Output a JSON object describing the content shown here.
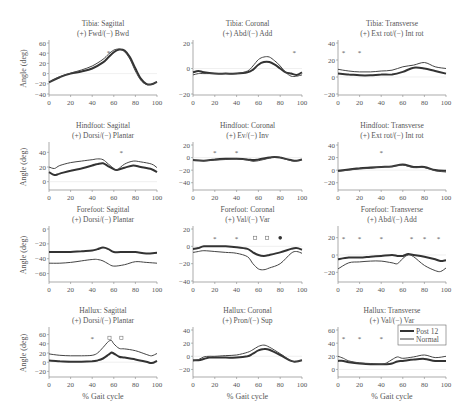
{
  "figure": {
    "legend": [
      {
        "label": "Post 12",
        "color": "#333333",
        "width": 2.0
      },
      {
        "label": "Normal",
        "color": "#444444",
        "width": 1.0
      }
    ],
    "xlabel": "% Gait cycle",
    "ylabel": "Angle (deg)"
  },
  "chart_data": [
    {
      "type": "line",
      "title": "Tibia: Sagittal",
      "subtitle": "(+) Fwd/(−) Bwd",
      "xlim": [
        0,
        100
      ],
      "ylim": [
        -40,
        60
      ],
      "yticks": [
        -40,
        -20,
        0,
        20,
        40,
        60
      ],
      "xticks": [
        0,
        20,
        40,
        60,
        80,
        100
      ],
      "x": [
        0,
        10,
        20,
        30,
        40,
        50,
        55,
        60,
        65,
        70,
        75,
        80,
        85,
        90,
        95,
        100
      ],
      "series": [
        {
          "name": "Post 12",
          "values": [
            -17,
            -7,
            0,
            4,
            10,
            22,
            32,
            42,
            47,
            45,
            32,
            10,
            -10,
            -20,
            -21,
            -16
          ]
        },
        {
          "name": "Normal",
          "values": [
            -17,
            -6,
            1,
            7,
            15,
            28,
            38,
            46,
            48,
            43,
            28,
            5,
            -13,
            -21,
            -21,
            -16
          ]
        }
      ],
      "markers": [
        {
          "x": 55,
          "type": "*"
        }
      ]
    },
    {
      "type": "line",
      "title": "Tibia: Coronal",
      "subtitle": "(+) Abd/(−) Add",
      "xlim": [
        0,
        100
      ],
      "ylim": [
        -20,
        20
      ],
      "yticks": [
        -20,
        0,
        20
      ],
      "xticks": [
        0,
        20,
        40,
        60,
        80,
        100
      ],
      "x": [
        0,
        5,
        10,
        20,
        30,
        40,
        50,
        55,
        60,
        65,
        70,
        75,
        80,
        85,
        90,
        95,
        100
      ],
      "series": [
        {
          "name": "Post 12",
          "values": [
            -3,
            -2,
            -3,
            -4,
            -4,
            -4,
            -3,
            -1,
            3,
            5,
            5,
            3,
            0,
            -3,
            -4,
            -5,
            -3
          ]
        },
        {
          "name": "Normal",
          "values": [
            -5,
            -4,
            -4,
            -4,
            -4,
            -4,
            -2,
            2,
            7,
            9,
            9,
            6,
            2,
            -3,
            -6,
            -6,
            -5
          ]
        }
      ],
      "markers": [
        {
          "x": 93,
          "type": "*"
        }
      ]
    },
    {
      "type": "line",
      "title": "Tibia: Transverse",
      "subtitle": "(+) Ext rot/(−) Int rot",
      "xlim": [
        0,
        100
      ],
      "ylim": [
        -20,
        40
      ],
      "yticks": [
        -20,
        0,
        20,
        40
      ],
      "xticks": [
        0,
        20,
        40,
        60,
        80,
        100
      ],
      "x": [
        0,
        10,
        20,
        30,
        40,
        50,
        60,
        70,
        80,
        90,
        100
      ],
      "series": [
        {
          "name": "Post 12",
          "values": [
            4,
            3,
            2,
            2,
            3,
            3,
            6,
            11,
            10,
            7,
            4
          ]
        },
        {
          "name": "Normal",
          "values": [
            9,
            7,
            6,
            6,
            7,
            8,
            12,
            14,
            17,
            12,
            10
          ]
        }
      ],
      "markers": [
        {
          "x": 5,
          "type": "*"
        },
        {
          "x": 20,
          "type": "*"
        }
      ]
    },
    {
      "type": "line",
      "title": "Hindfoot: Sagittal",
      "subtitle": "(+) Dorsi/(−) Plantar",
      "xlim": [
        0,
        100
      ],
      "ylim": [
        -10,
        50
      ],
      "yticks": [
        0,
        20,
        40
      ],
      "xticks": [
        0,
        20,
        40,
        60,
        80,
        100
      ],
      "x": [
        0,
        5,
        10,
        20,
        30,
        40,
        45,
        50,
        55,
        60,
        63,
        70,
        78,
        85,
        95,
        100
      ],
      "series": [
        {
          "name": "Post 12",
          "values": [
            13,
            9,
            11,
            15,
            18,
            22,
            24,
            25,
            21,
            17,
            16,
            19,
            22,
            20,
            17,
            13
          ]
        },
        {
          "name": "Normal",
          "values": [
            20,
            18,
            22,
            26,
            28,
            30,
            31,
            30,
            24,
            18,
            16,
            24,
            28,
            27,
            24,
            19
          ]
        }
      ],
      "markers": [
        {
          "x": 67,
          "type": "*"
        }
      ]
    },
    {
      "type": "line",
      "title": "Hindfoot: Coronal",
      "subtitle": "(+) Ev/(−) Inv",
      "xlim": [
        0,
        100
      ],
      "ylim": [
        -50,
        20
      ],
      "yticks": [
        -40,
        -20,
        0,
        20
      ],
      "xticks": [
        0,
        20,
        40,
        60,
        80,
        100
      ],
      "x": [
        0,
        10,
        20,
        30,
        40,
        50,
        55,
        60,
        70,
        75,
        80,
        90,
        95,
        100
      ],
      "series": [
        {
          "name": "Post 12",
          "values": [
            -4,
            -5,
            -3,
            -2,
            -2,
            -3,
            -4,
            -3,
            0,
            1,
            0,
            -4,
            -5,
            -3
          ]
        },
        {
          "name": "Normal",
          "values": [
            -4,
            -5,
            -4,
            -3,
            -2,
            -4,
            -6,
            -5,
            -1,
            1,
            0,
            -5,
            -5,
            -3
          ]
        }
      ],
      "markers": [
        {
          "x": 20,
          "type": "*"
        },
        {
          "x": 40,
          "type": "*"
        }
      ]
    },
    {
      "type": "line",
      "title": "Hindfoot: Transverse",
      "subtitle": "(+) Ext rot/(−) Int rot",
      "xlim": [
        0,
        100
      ],
      "ylim": [
        -30,
        40
      ],
      "yticks": [
        -20,
        0,
        20,
        40
      ],
      "xticks": [
        0,
        20,
        40,
        60,
        80,
        100
      ],
      "x": [
        0,
        10,
        20,
        30,
        40,
        50,
        60,
        70,
        80,
        90,
        100
      ],
      "series": [
        {
          "name": "Post 12",
          "values": [
            -1,
            1,
            3,
            4,
            5,
            6,
            9,
            5,
            5,
            0,
            -1
          ]
        },
        {
          "name": "Normal",
          "values": [
            -2,
            0,
            2,
            3,
            5,
            6,
            8,
            4,
            4,
            -1,
            -3
          ]
        }
      ],
      "markers": [
        {
          "x": 40,
          "type": "*"
        }
      ]
    },
    {
      "type": "line",
      "title": "Forefoot: Sagittal",
      "subtitle": "(+) Dorsi/(−) Plantar",
      "xlim": [
        0,
        100
      ],
      "ylim": [
        -70,
        0
      ],
      "yticks": [
        -60,
        -40,
        -20,
        0
      ],
      "xticks": [
        0,
        20,
        40,
        60,
        80,
        100
      ],
      "x": [
        0,
        10,
        20,
        30,
        40,
        45,
        50,
        55,
        60,
        70,
        80,
        90,
        100
      ],
      "series": [
        {
          "name": "Post 12",
          "values": [
            -31,
            -31,
            -31,
            -30,
            -29,
            -27,
            -25,
            -27,
            -31,
            -31,
            -31,
            -33,
            -32
          ]
        },
        {
          "name": "Normal",
          "values": [
            -46,
            -46,
            -45,
            -43,
            -41,
            -41,
            -43,
            -47,
            -50,
            -48,
            -44,
            -45,
            -46
          ]
        }
      ],
      "markers": []
    },
    {
      "type": "line",
      "title": "Forefoot: Coronal",
      "subtitle": "(+) Val/(−) Var",
      "xlim": [
        0,
        100
      ],
      "ylim": [
        -40,
        20
      ],
      "yticks": [
        -40,
        -20,
        0,
        20
      ],
      "xticks": [
        0,
        20,
        40,
        60,
        80,
        100
      ],
      "x": [
        0,
        5,
        10,
        20,
        30,
        40,
        50,
        55,
        60,
        65,
        70,
        80,
        90,
        95,
        100
      ],
      "series": [
        {
          "name": "Post 12",
          "values": [
            -3,
            -2,
            0,
            0,
            0,
            -1,
            -3,
            -7,
            -10,
            -11,
            -10,
            -7,
            -3,
            -2,
            -4
          ]
        },
        {
          "name": "Normal",
          "values": [
            -7,
            -6,
            -5,
            -6,
            -7,
            -8,
            -12,
            -20,
            -26,
            -27,
            -25,
            -20,
            -8,
            -6,
            -8
          ]
        }
      ],
      "markers": [
        {
          "x": 20,
          "type": "*"
        },
        {
          "x": 40,
          "type": "*"
        },
        {
          "x": 57,
          "type": "o"
        },
        {
          "x": 68,
          "type": "o"
        },
        {
          "x": 80,
          "type": "filled"
        }
      ]
    },
    {
      "type": "line",
      "title": "Forefoot: Transverse",
      "subtitle": "(+) Abd/(−) Add",
      "xlim": [
        0,
        100
      ],
      "ylim": [
        -30,
        30
      ],
      "yticks": [
        -20,
        0,
        20
      ],
      "xticks": [
        0,
        20,
        40,
        60,
        80,
        100
      ],
      "x": [
        0,
        10,
        20,
        30,
        40,
        50,
        55,
        60,
        65,
        70,
        80,
        90,
        95,
        100
      ],
      "series": [
        {
          "name": "Post 12",
          "values": [
            -5,
            -3,
            -3,
            -2,
            -1,
            0,
            -1,
            -1,
            1,
            0,
            -2,
            -5,
            -7,
            -6
          ]
        },
        {
          "name": "Normal",
          "values": [
            -16,
            -9,
            -8,
            -7,
            -7,
            -9,
            -10,
            -4,
            0,
            -2,
            -12,
            -18,
            -19,
            -15
          ]
        }
      ],
      "markers": [
        {
          "x": 5,
          "type": "*"
        },
        {
          "x": 20,
          "type": "*"
        },
        {
          "x": 40,
          "type": "*"
        },
        {
          "x": 68,
          "type": "*"
        },
        {
          "x": 80,
          "type": "*"
        },
        {
          "x": 93,
          "type": "*"
        }
      ]
    },
    {
      "type": "line",
      "title": "Hallux: Sagittal",
      "subtitle": "(+) Dorsi/(−) Plantar",
      "xlim": [
        0,
        100
      ],
      "ylim": [
        -30,
        70
      ],
      "yticks": [
        -20,
        0,
        20,
        40,
        60
      ],
      "xticks": [
        0,
        20,
        40,
        60,
        80,
        100
      ],
      "x": [
        0,
        10,
        20,
        30,
        40,
        45,
        50,
        55,
        58,
        60,
        65,
        70,
        80,
        90,
        95,
        100
      ],
      "series": [
        {
          "name": "Post 12",
          "values": [
            4,
            2,
            1,
            1,
            2,
            4,
            8,
            16,
            21,
            19,
            12,
            10,
            6,
            1,
            -2,
            3
          ]
        },
        {
          "name": "Normal",
          "values": [
            18,
            15,
            14,
            14,
            15,
            20,
            32,
            45,
            47,
            40,
            30,
            29,
            25,
            17,
            14,
            19
          ]
        }
      ],
      "markers": [
        {
          "x": 40,
          "type": "*"
        },
        {
          "x": 56,
          "type": "o"
        },
        {
          "x": 67,
          "type": "o"
        }
      ]
    },
    {
      "type": "line",
      "title": "Hallux: Coronal",
      "subtitle": "(+) Pron/(−) Sup",
      "xlim": [
        0,
        100
      ],
      "ylim": [
        -30,
        40
      ],
      "yticks": [
        -20,
        0,
        20,
        40
      ],
      "xticks": [
        0,
        20,
        40,
        60,
        80,
        100
      ],
      "x": [
        0,
        5,
        10,
        15,
        20,
        30,
        40,
        50,
        55,
        60,
        65,
        70,
        80,
        90,
        95,
        100
      ],
      "series": [
        {
          "name": "Post 12",
          "values": [
            -6,
            -6,
            -4,
            -2,
            -2,
            -2,
            -2,
            0,
            4,
            9,
            11,
            10,
            2,
            -7,
            -8,
            -6
          ]
        },
        {
          "name": "Normal",
          "values": [
            -7,
            -5,
            -1,
            0,
            0,
            1,
            2,
            6,
            10,
            15,
            17,
            14,
            4,
            -7,
            -8,
            -6
          ]
        }
      ],
      "markers": []
    },
    {
      "type": "line",
      "title": "Hallux: Transverse",
      "subtitle": "(+) Val/(−) Var",
      "xlim": [
        0,
        100
      ],
      "ylim": [
        -10,
        60
      ],
      "yticks": [
        0,
        20,
        40,
        60
      ],
      "xticks": [
        0,
        20,
        40,
        60,
        80,
        100
      ],
      "x": [
        0,
        5,
        10,
        20,
        30,
        40,
        45,
        50,
        55,
        60,
        70,
        80,
        90,
        100
      ],
      "series": [
        {
          "name": "Post 12",
          "values": [
            13,
            13,
            11,
            9,
            8,
            8,
            8,
            9,
            12,
            13,
            15,
            16,
            13,
            13
          ]
        },
        {
          "name": "Normal",
          "values": [
            20,
            17,
            13,
            10,
            9,
            8,
            10,
            15,
            19,
            17,
            19,
            22,
            18,
            20
          ]
        }
      ],
      "markers": [
        {
          "x": 5,
          "type": "*"
        },
        {
          "x": 20,
          "type": "*"
        },
        {
          "x": 40,
          "type": "*"
        },
        {
          "x": 93,
          "type": "*"
        }
      ]
    }
  ]
}
